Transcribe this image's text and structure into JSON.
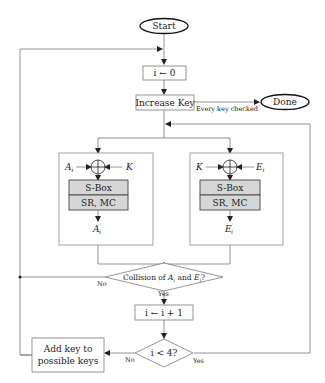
{
  "diagram": {
    "type": "flowchart",
    "nodes": {
      "start": "Start",
      "init": "i ← 0",
      "increase_key": "Increase Key",
      "done": "Done",
      "every_key_checked": "Every key checked",
      "left_panel": {
        "input": "A",
        "input_sub": "i",
        "key": "K",
        "sbox": "S-Box",
        "srmc": "SR, MC",
        "output": "A",
        "output_sup": "′",
        "output_sub": "i"
      },
      "right_panel": {
        "key": "K",
        "input": "E",
        "input_sub": "i",
        "sbox": "S-Box",
        "srmc": "SR, MC",
        "output": "E",
        "output_sup": "′",
        "output_sub": "i"
      },
      "collision": {
        "prefix": "Collision of ",
        "a": "A",
        "a_sub": "i",
        "mid": " and ",
        "e": "E",
        "e_sub": "i",
        "suffix": "?"
      },
      "increment": "i ← i + 1",
      "loop_check": "i < 4?",
      "add_key_line1": "Add key to",
      "add_key_line2": "possible keys"
    },
    "edge_labels": {
      "collision_no": "No",
      "collision_yes": "Yes",
      "check_no": "No",
      "check_yes": "Yes"
    }
  }
}
